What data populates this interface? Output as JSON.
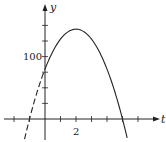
{
  "chart_data": {
    "type": "line",
    "title": "",
    "xlabel": "t",
    "ylabel": "y",
    "function": "y = 80 + 64t - 16t^2",
    "x_tick_step": 1,
    "y_tick_step": 25,
    "x_ticks": [
      -2,
      -1,
      0,
      1,
      2,
      3,
      4,
      5,
      6
    ],
    "y_ticks": [
      25,
      50,
      75,
      100,
      125,
      150
    ],
    "x_tick_labels": [
      {
        "value": 2,
        "label": "2"
      }
    ],
    "y_tick_labels": [
      {
        "value": 100,
        "label": "100"
      }
    ],
    "xlim": [
      -3,
      7
    ],
    "ylim": [
      -25,
      165
    ],
    "grid": false,
    "series": [
      {
        "name": "dashed-segment",
        "style": "dashed",
        "x": [
          -1.5,
          -1,
          -0.5,
          0
        ],
        "y": [
          -20,
          0,
          44,
          80
        ]
      },
      {
        "name": "solid-curve",
        "style": "solid",
        "x": [
          0,
          0.5,
          1,
          1.5,
          2,
          2.5,
          3,
          3.5,
          4,
          4.5,
          5,
          5.3
        ],
        "y": [
          80,
          108,
          128,
          140,
          144,
          140,
          128,
          108,
          80,
          44,
          0,
          -25
        ]
      }
    ],
    "annotations": []
  },
  "labels": {
    "x_axis": "t",
    "y_axis": "y",
    "tick_2": "2",
    "tick_100": "100"
  }
}
